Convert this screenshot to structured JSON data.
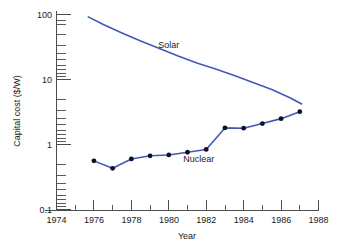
{
  "chart_data": {
    "type": "line",
    "title": "",
    "xlabel": "Year",
    "ylabel": "Capital cost ($/W)",
    "xlim": [
      1974,
      1988
    ],
    "ylim": [
      0.1,
      100
    ],
    "yscale": "log",
    "grid": false,
    "legend": "inline-labels",
    "x_ticks_major": [
      1974,
      1976,
      1978,
      1980,
      1982,
      1984,
      1986,
      1988
    ],
    "x_tick_labels": [
      "1974",
      "1976",
      "1978",
      "1980",
      "1982",
      "1984",
      "1986",
      "1988"
    ],
    "x_ticks_minor": [
      1975,
      1977,
      1979,
      1981,
      1983,
      1985,
      1987
    ],
    "y_ticks_major": [
      0.1,
      1,
      10,
      100
    ],
    "y_tick_labels": [
      "0.1",
      "1",
      "10",
      "100"
    ],
    "series": [
      {
        "name": "Solar",
        "label": "Solar",
        "color": "#4258b8",
        "markers": false,
        "x": [
          1975.7,
          1976.5,
          1977.5,
          1978.5,
          1979.5,
          1980.5,
          1981.5,
          1982.5,
          1983.5,
          1984.5,
          1985.5,
          1986.5,
          1987.1
        ],
        "values": [
          92,
          70,
          52,
          39,
          30,
          23,
          18,
          14.5,
          11.5,
          9.0,
          7.0,
          5.2,
          4.2
        ]
      },
      {
        "name": "Nuclear",
        "label": "Nuclear",
        "color": "#4258b8",
        "markers": true,
        "x": [
          1976,
          1977,
          1978,
          1979,
          1980,
          1981,
          1982,
          1983,
          1984,
          1985,
          1986,
          1987
        ],
        "values": [
          0.56,
          0.43,
          0.6,
          0.67,
          0.69,
          0.76,
          0.84,
          1.8,
          1.78,
          2.1,
          2.5,
          3.2
        ]
      }
    ],
    "annotations": [
      {
        "text": "Solar",
        "x": 1980.0,
        "y": 30
      },
      {
        "text": "Nuclear",
        "x": 1981.6,
        "y": 0.53
      }
    ]
  }
}
